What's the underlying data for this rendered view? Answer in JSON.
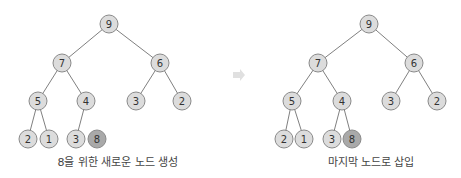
{
  "diagrams": [
    {
      "caption": "8을 위한 새로운 노드 생성",
      "nodes": [
        {
          "id": "n9",
          "label": "9",
          "x": 109,
          "y": 24
        },
        {
          "id": "n7",
          "label": "7",
          "x": 62,
          "y": 63
        },
        {
          "id": "n6",
          "label": "6",
          "x": 160,
          "y": 63
        },
        {
          "id": "n5",
          "label": "5",
          "x": 38,
          "y": 101
        },
        {
          "id": "n4",
          "label": "4",
          "x": 86,
          "y": 101
        },
        {
          "id": "n3a",
          "label": "3",
          "x": 136,
          "y": 101
        },
        {
          "id": "n2a",
          "label": "2",
          "x": 182,
          "y": 101
        },
        {
          "id": "n2b",
          "label": "2",
          "x": 28,
          "y": 139
        },
        {
          "id": "n1",
          "label": "1",
          "x": 49,
          "y": 139
        },
        {
          "id": "n3b",
          "label": "3",
          "x": 76,
          "y": 139
        },
        {
          "id": "n8",
          "label": "8",
          "x": 97,
          "y": 139,
          "new": true
        }
      ],
      "edges": [
        [
          "n9",
          "n7"
        ],
        [
          "n9",
          "n6"
        ],
        [
          "n7",
          "n5"
        ],
        [
          "n7",
          "n4"
        ],
        [
          "n6",
          "n3a"
        ],
        [
          "n6",
          "n2a"
        ],
        [
          "n5",
          "n2b"
        ],
        [
          "n5",
          "n1"
        ],
        [
          "n4",
          "n3b"
        ]
      ]
    },
    {
      "caption": "마지막 노드로 삽입",
      "nodes": [
        {
          "id": "m9",
          "label": "9",
          "x": 369,
          "y": 24
        },
        {
          "id": "m7",
          "label": "7",
          "x": 318,
          "y": 63
        },
        {
          "id": "m6",
          "label": "6",
          "x": 414,
          "y": 63
        },
        {
          "id": "m5",
          "label": "5",
          "x": 292,
          "y": 101
        },
        {
          "id": "m4",
          "label": "4",
          "x": 342,
          "y": 101
        },
        {
          "id": "m3a",
          "label": "3",
          "x": 391,
          "y": 101
        },
        {
          "id": "m2a",
          "label": "2",
          "x": 437,
          "y": 101
        },
        {
          "id": "m2b",
          "label": "2",
          "x": 284,
          "y": 139
        },
        {
          "id": "m1",
          "label": "1",
          "x": 304,
          "y": 139
        },
        {
          "id": "m3b",
          "label": "3",
          "x": 332,
          "y": 139
        },
        {
          "id": "m8",
          "label": "8",
          "x": 352,
          "y": 139,
          "new": true
        }
      ],
      "edges": [
        [
          "m9",
          "m7"
        ],
        [
          "m9",
          "m6"
        ],
        [
          "m7",
          "m5"
        ],
        [
          "m7",
          "m4"
        ],
        [
          "m6",
          "m3a"
        ],
        [
          "m6",
          "m2a"
        ],
        [
          "m5",
          "m2b"
        ],
        [
          "m5",
          "m1"
        ],
        [
          "m4",
          "m3b"
        ],
        [
          "m4",
          "m8"
        ]
      ]
    }
  ],
  "arrow": {
    "direction": "right",
    "x": 238,
    "y": 75
  },
  "colors": {
    "node_fill": "#dcdcdc",
    "new_node_fill": "#a9a9a9",
    "edge": "#808080"
  }
}
